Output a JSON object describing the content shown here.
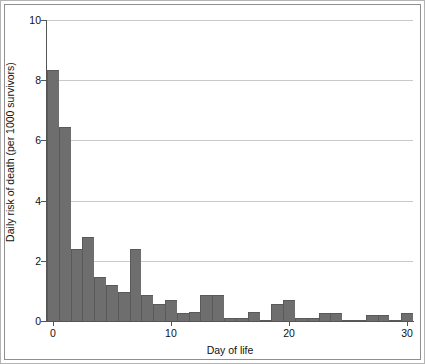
{
  "chart_data": {
    "type": "bar",
    "title": "",
    "xlabel": "Day of life",
    "ylabel": "Daily risk of death (per 1000 survivors)",
    "xlim": [
      -0.5,
      30.5
    ],
    "ylim": [
      0,
      10
    ],
    "grid": true,
    "legend": null,
    "bar_color": "#6e6e6e",
    "x_ticks": [
      0,
      10,
      20,
      30
    ],
    "x_tick_labels": [
      "0",
      "10",
      "20",
      "30"
    ],
    "y_ticks": [
      0,
      2,
      4,
      6,
      8,
      10
    ],
    "y_tick_labels": [
      "0",
      "2",
      "4",
      "6",
      "8",
      "10"
    ],
    "categories": [
      0,
      1,
      2,
      3,
      4,
      5,
      6,
      7,
      8,
      9,
      10,
      11,
      12,
      13,
      14,
      15,
      16,
      17,
      18,
      19,
      20,
      21,
      22,
      23,
      24,
      25,
      26,
      27,
      28,
      29,
      30
    ],
    "values": [
      8.35,
      6.45,
      2.4,
      2.8,
      1.45,
      1.2,
      0.95,
      2.4,
      0.85,
      0.55,
      0.7,
      0.25,
      0.3,
      0.85,
      0.85,
      0.1,
      0.1,
      0.3,
      0.05,
      0.55,
      0.7,
      0.1,
      0.1,
      0.25,
      0.25,
      0.05,
      0.05,
      0.2,
      0.2,
      0.05,
      0.25
    ]
  },
  "axis": {
    "y_title": "Daily risk of death (per 1000 survivors)",
    "x_title": "Day of life"
  }
}
